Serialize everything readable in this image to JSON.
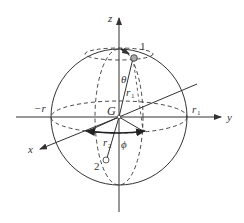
{
  "diagram": {
    "title": "",
    "axes": {
      "z": "z",
      "y": "y",
      "x": "x"
    },
    "center_label": "G",
    "labels": {
      "neg_r": "−r",
      "r1_right_main": "r",
      "r1_right_sub": "1",
      "r1_radius_main": "r",
      "r1_radius_sub": "1",
      "r2_main": "r",
      "r2_sub": "2",
      "theta": "θ",
      "phi": "ϕ",
      "point1": "1",
      "point2": "2"
    },
    "colors": {
      "stroke": "#333333",
      "point1_fill": "#aaaaaa",
      "point2_fill": "#ffffff"
    }
  }
}
